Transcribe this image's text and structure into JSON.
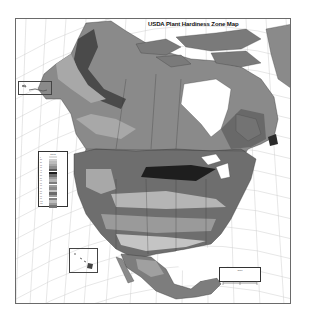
{
  "map": {
    "title": "USDA Plant Hardiness Zone Map",
    "subject": "North America",
    "style": "grayscale",
    "colors": {
      "frame": "#6a6a6a",
      "graticule": "#c8c8c8",
      "water": "#ffffff",
      "zone_darkest": "#1a1a1a",
      "zone_dark": "#4a4a4a",
      "zone_mid": "#7a7a7a",
      "zone_light": "#a8a8a8",
      "zone_lightest": "#cfcfcf"
    },
    "zone_legend": {
      "title": "Zones",
      "zones": [
        {
          "label": "1",
          "color": "#e0e0e0"
        },
        {
          "label": "2a",
          "color": "#cfcfcf"
        },
        {
          "label": "2b",
          "color": "#bdbdbd"
        },
        {
          "label": "3a",
          "color": "#a8a8a8"
        },
        {
          "label": "3b",
          "color": "#8f8f8f"
        },
        {
          "label": "4a",
          "color": "#5a5a5a"
        },
        {
          "label": "4b",
          "color": "#1e1e1e"
        },
        {
          "label": "5a",
          "color": "#6e6e6e"
        },
        {
          "label": "5b",
          "color": "#9a9a9a"
        },
        {
          "label": "6a",
          "color": "#b5b5b5"
        },
        {
          "label": "6b",
          "color": "#7d7d7d"
        },
        {
          "label": "7a",
          "color": "#a0a0a0"
        },
        {
          "label": "7b",
          "color": "#8a8a8a"
        },
        {
          "label": "8a",
          "color": "#c4c4c4"
        },
        {
          "label": "8b",
          "color": "#6a6a6a"
        },
        {
          "label": "9a",
          "color": "#9c9c9c"
        },
        {
          "label": "9b",
          "color": "#808080"
        },
        {
          "label": "10a",
          "color": "#bcbcbc"
        },
        {
          "label": "10b",
          "color": "#9a9a9a"
        },
        {
          "label": "11",
          "color": "#747474"
        }
      ]
    },
    "insets": {
      "alaska_islands": "Aleutian Islands inset",
      "hawaii": "Hawaii inset"
    },
    "scale_box": {
      "label": "Scale"
    }
  }
}
